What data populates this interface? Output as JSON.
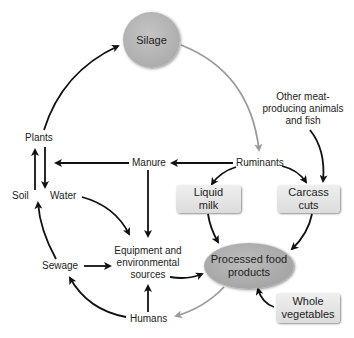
{
  "diagram": {
    "nodes": {
      "silage": "Silage",
      "other_meat": [
        "Other meat-",
        "producing animals",
        "and fish"
      ],
      "plants": "Plants",
      "manure": "Manure",
      "ruminants": "Ruminants",
      "soil": "Soil",
      "water": "Water",
      "liquid_milk": [
        "Liquid",
        "milk"
      ],
      "carcass_cuts": [
        "Carcass",
        "cuts"
      ],
      "equipment": [
        "Equipment and",
        "environmental",
        "sources"
      ],
      "sewage": "Sewage",
      "processed_food": [
        "Processed food",
        "products"
      ],
      "whole_vegetables": [
        "Whole",
        "vegetables"
      ],
      "humans": "Humans"
    },
    "edges": [
      {
        "from": "Plants",
        "to": "Silage",
        "color": "#111111"
      },
      {
        "from": "Silage",
        "to": "Ruminants",
        "color": "#9a9a9a"
      },
      {
        "from": "Other meat-producing animals and fish",
        "to": "Carcass cuts",
        "color": "#111111"
      },
      {
        "from": "Ruminants",
        "to": "Manure",
        "color": "#111111"
      },
      {
        "from": "Manure",
        "to": "Plants",
        "color": "#111111"
      },
      {
        "from": "Ruminants",
        "to": "Liquid milk",
        "color": "#111111"
      },
      {
        "from": "Ruminants",
        "to": "Carcass cuts",
        "color": "#111111"
      },
      {
        "from": "Soil",
        "to": "Plants",
        "color": "#111111"
      },
      {
        "from": "Plants",
        "to": "Water",
        "color": "#111111"
      },
      {
        "from": "Water",
        "to": "Equipment and environmental sources",
        "color": "#111111"
      },
      {
        "from": "Manure",
        "to": "Equipment and environmental sources",
        "color": "#111111"
      },
      {
        "from": "Liquid milk",
        "to": "Processed food products",
        "color": "#111111"
      },
      {
        "from": "Carcass cuts",
        "to": "Processed food products",
        "color": "#111111"
      },
      {
        "from": "Sewage",
        "to": "Soil",
        "color": "#111111"
      },
      {
        "from": "Sewage",
        "to": "Equipment and environmental sources",
        "color": "#111111"
      },
      {
        "from": "Equipment and environmental sources",
        "to": "Processed food products",
        "color": "#111111"
      },
      {
        "from": "Whole vegetables",
        "to": "Processed food products",
        "color": "#111111"
      },
      {
        "from": "Processed food products",
        "to": "Humans",
        "color": "#9a9a9a"
      },
      {
        "from": "Humans",
        "to": "Sewage",
        "color": "#111111"
      },
      {
        "from": "Humans",
        "to": "Equipment and environmental sources",
        "color": "#111111"
      }
    ],
    "colors": {
      "arrow_dark": "#111111",
      "arrow_grey": "#9a9a9a",
      "circle_fill": "#b0b0b0",
      "box_fill": "#e4e4e4"
    }
  }
}
